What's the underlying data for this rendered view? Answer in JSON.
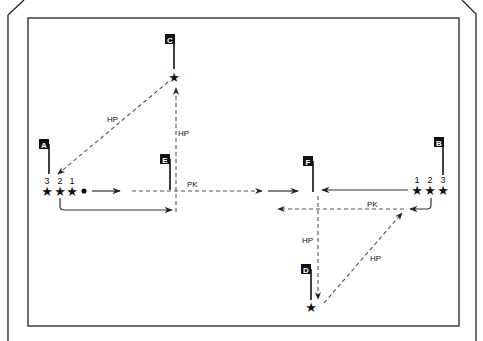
{
  "diagram": {
    "type": "drill-diagram",
    "players_left": {
      "numbers": [
        "3",
        "2",
        "1"
      ],
      "ball": "dot"
    },
    "players_right": {
      "numbers": [
        "1",
        "2",
        "3"
      ]
    },
    "cone_labels": {
      "A": "A",
      "B": "B",
      "C": "C",
      "D": "D",
      "E": "E",
      "F": "F"
    },
    "pass_labels": {
      "hp_c_to_a": "HP",
      "hp_e_to_c": "HP",
      "pk_left": "PK",
      "pk_right": "PK",
      "hp_f_to_d": "HP",
      "hp_d_to_b": "HP"
    },
    "star_glyph": "★"
  }
}
